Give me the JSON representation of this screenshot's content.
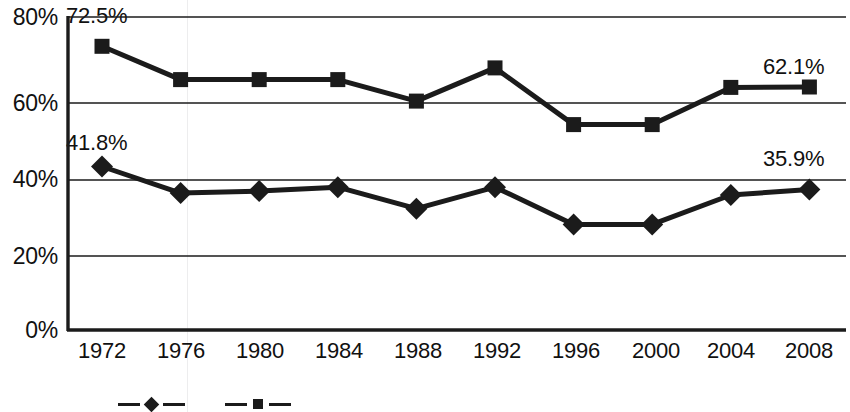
{
  "chart_data": {
    "type": "line",
    "title": "",
    "subtitle": "",
    "xlabel": "",
    "ylabel": "",
    "categories": [
      "1972",
      "1976",
      "1980",
      "1984",
      "1988",
      "1992",
      "1996",
      "2000",
      "2004",
      "2008"
    ],
    "x": [
      1972,
      1976,
      1980,
      1984,
      1988,
      1992,
      1996,
      2000,
      2004,
      2008
    ],
    "series": [
      {
        "name": "Upper series",
        "marker": "square",
        "color": "#1b1b1b",
        "values": [
          72.5,
          64.0,
          64.0,
          64.0,
          58.5,
          67.0,
          52.5,
          52.5,
          62.0,
          62.1
        ],
        "point_labels": {
          "1972": "72.5%",
          "2008": "62.1%"
        }
      },
      {
        "name": "Lower series",
        "marker": "diamond",
        "color": "#1b1b1b",
        "values": [
          41.8,
          35.0,
          35.5,
          36.5,
          31.0,
          36.5,
          27.0,
          27.0,
          34.5,
          35.9
        ],
        "point_labels": {
          "1972": "41.8%",
          "2008": "35.9%"
        }
      }
    ],
    "ylim": [
      0,
      80
    ],
    "yticks": [
      0,
      20,
      40,
      60,
      80
    ],
    "ytick_labels": [
      "0%",
      "20%",
      "40%",
      "60%",
      "80%"
    ],
    "grid": true,
    "grid_axis": "y",
    "legend_position": "bottom"
  },
  "annotations": {
    "top_left_value": "72.5%",
    "top_right_value": "62.1%",
    "bottom_left_value": "41.8%",
    "bottom_right_value": "35.9%"
  },
  "legend": {
    "items": [
      {
        "label": "",
        "marker": "diamond"
      },
      {
        "label": "",
        "marker": "square"
      }
    ]
  }
}
